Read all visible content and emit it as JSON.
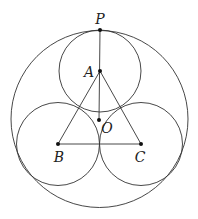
{
  "diagram": {
    "type": "geometry",
    "colors": {
      "line": "#333333",
      "point": "#111111",
      "background": "#ffffff"
    },
    "outer_circle": {
      "cx": 99.5,
      "cy": 119,
      "r": 88.5
    },
    "inner_circles": [
      {
        "center": "A",
        "cx": 100,
        "cy": 71,
        "r": 41
      },
      {
        "center": "B",
        "cx": 58,
        "cy": 144,
        "r": 41.5
      },
      {
        "center": "C",
        "cx": 141,
        "cy": 144,
        "r": 41.5
      }
    ],
    "points": [
      {
        "name": "P",
        "x": 100,
        "y": 30,
        "label_x": 100,
        "label_y": 24
      },
      {
        "name": "A",
        "x": 100,
        "y": 71,
        "label_x": 89,
        "label_y": 77
      },
      {
        "name": "O",
        "x": 99,
        "y": 120,
        "label_x": 107,
        "label_y": 133
      },
      {
        "name": "B",
        "x": 58,
        "y": 144,
        "label_x": 59,
        "label_y": 162
      },
      {
        "name": "C",
        "x": 141,
        "y": 144,
        "label_x": 140,
        "label_y": 162
      }
    ],
    "segments": [
      {
        "from": "P",
        "to": "O",
        "x1": 100,
        "y1": 30,
        "x2": 99,
        "y2": 120
      },
      {
        "from": "A",
        "to": "B",
        "x1": 100,
        "y1": 71,
        "x2": 58,
        "y2": 144
      },
      {
        "from": "A",
        "to": "C",
        "x1": 100,
        "y1": 71,
        "x2": 141,
        "y2": 144
      },
      {
        "from": "B",
        "to": "C",
        "x1": 58,
        "y1": 144,
        "x2": 141,
        "y2": 144
      }
    ],
    "labels": {
      "P": "P",
      "A": "A",
      "O": "O",
      "B": "B",
      "C": "C"
    }
  }
}
